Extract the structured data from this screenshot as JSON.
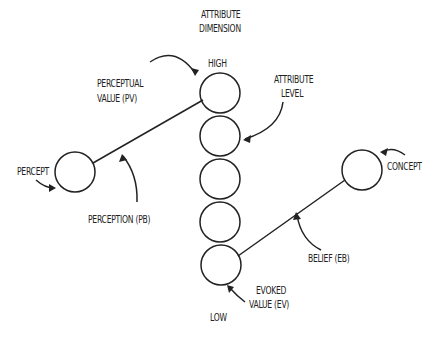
{
  "diagram": {
    "axis_title_line1": "ATTRIBUTE",
    "axis_title_line2": "DIMENSION",
    "high_label": "HIGH",
    "low_label": "LOW",
    "attribute_level_line1": "ATTRIBUTE",
    "attribute_level_line2": "LEVEL",
    "perceptual_value_line1": "PERCEPTUAL",
    "perceptual_value_line2": "VALUE (PV)",
    "percept_label": "PERCEPT",
    "perception_label": "PERCEPTION (PB)",
    "concept_label": "CONCEPT",
    "belief_label": "BELIEF (EB)",
    "evoked_value_line1": "EVOKED",
    "evoked_value_line2": "VALUE (EV)",
    "attribute_levels_count": 5,
    "stroke_color": "#222222"
  }
}
